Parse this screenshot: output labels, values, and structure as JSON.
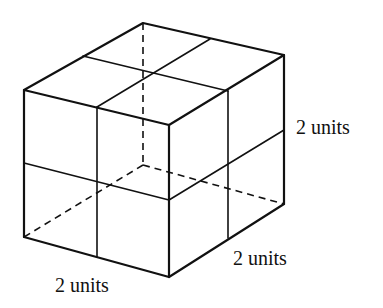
{
  "diagram": {
    "labels": {
      "height": "2 units",
      "depth": "2 units",
      "width": "2 units"
    },
    "vertices": {
      "top_back": [
        143,
        23
      ],
      "top_left": [
        24,
        90
      ],
      "top_front": [
        169,
        125
      ],
      "top_right": [
        284,
        55
      ],
      "bottom_left": [
        24,
        237
      ],
      "bottom_front": [
        169,
        277
      ],
      "bottom_right": [
        284,
        204
      ],
      "hidden_back_bottom": [
        143,
        165
      ]
    },
    "colors": {
      "line": "#111111",
      "background": "#ffffff"
    }
  }
}
